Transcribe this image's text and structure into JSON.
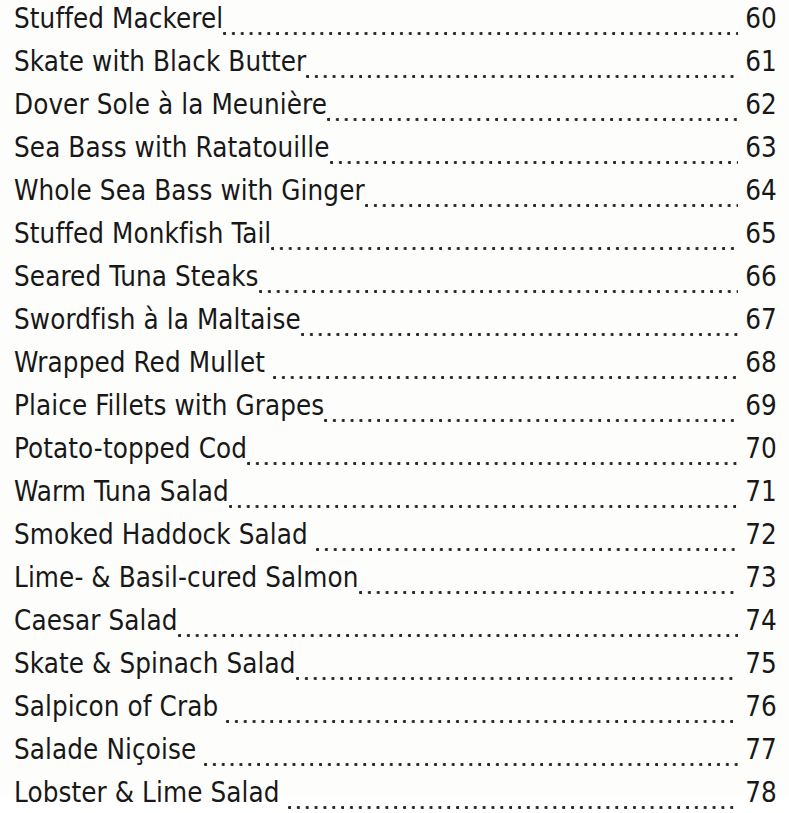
{
  "page": {
    "type": "table-of-contents",
    "background_color": "#fdfdfc",
    "text_color": "#181818",
    "leader_style": "dotted",
    "entry_count": 19,
    "page_number_range": [
      60,
      78
    ]
  },
  "entries": [
    {
      "title": "Stuffed Mackerel",
      "page": "60"
    },
    {
      "title": "Skate with Black Butter",
      "page": "61"
    },
    {
      "title": "Dover Sole à la Meunière",
      "page": "62"
    },
    {
      "title": "Sea Bass with Ratatouille",
      "page": "63"
    },
    {
      "title": "Whole Sea Bass with Ginger",
      "page": "64"
    },
    {
      "title": "Stuffed Monkfish Tail",
      "page": "65"
    },
    {
      "title": "Seared Tuna Steaks",
      "page": "66"
    },
    {
      "title": "Swordfish à la Maltaise",
      "page": "67"
    },
    {
      "title": "Wrapped Red Mullet ",
      "page": "68"
    },
    {
      "title": "Plaice Fillets with Grapes",
      "page": "69"
    },
    {
      "title": "Potato-topped Cod",
      "page": "70"
    },
    {
      "title": "Warm Tuna Salad",
      "page": "71"
    },
    {
      "title": "Smoked Haddock Salad ",
      "page": "72"
    },
    {
      "title": "Lime- & Basil-cured Salmon",
      "page": "73"
    },
    {
      "title": "Caesar Salad",
      "page": "74"
    },
    {
      "title": "Skate & Spinach Salad",
      "page": "75"
    },
    {
      "title": "Salpicon of Crab ",
      "page": "76"
    },
    {
      "title": "Salade Niçoise ",
      "page": "77"
    },
    {
      "title": "Lobster & Lime Salad ",
      "page": "78"
    }
  ]
}
